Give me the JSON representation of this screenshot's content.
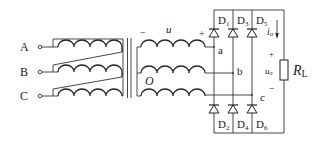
{
  "diagram": {
    "type": "three-phase transformer with bridge rectifier",
    "primary_terminals": [
      {
        "label": "A",
        "y": 47
      },
      {
        "label": "B",
        "y": 72
      },
      {
        "label": "C",
        "y": 96
      }
    ],
    "secondary": {
      "voltage_label": "u",
      "minus_sign": "−",
      "plus_sign": "+",
      "neutral_label": "O",
      "phase_nodes": [
        {
          "label": "a",
          "y": 47
        },
        {
          "label": "b",
          "y": 73
        },
        {
          "label": "c",
          "y": 95
        }
      ]
    },
    "diodes_top": [
      {
        "name": "D",
        "sub": "1",
        "x": 214
      },
      {
        "name": "D",
        "sub": "3",
        "x": 233
      },
      {
        "name": "D",
        "sub": "5",
        "x": 252
      }
    ],
    "diodes_bottom": [
      {
        "name": "D",
        "sub": "2",
        "x": 214
      },
      {
        "name": "D",
        "sub": "4",
        "x": 233
      },
      {
        "name": "D",
        "sub": "6",
        "x": 252
      }
    ],
    "load": {
      "resistor_label": "R",
      "resistor_sub": "L",
      "current_label": "i",
      "current_sub": "o",
      "voltage_label": "u",
      "voltage_sub": "o",
      "plus": "+",
      "minus": "−"
    }
  }
}
